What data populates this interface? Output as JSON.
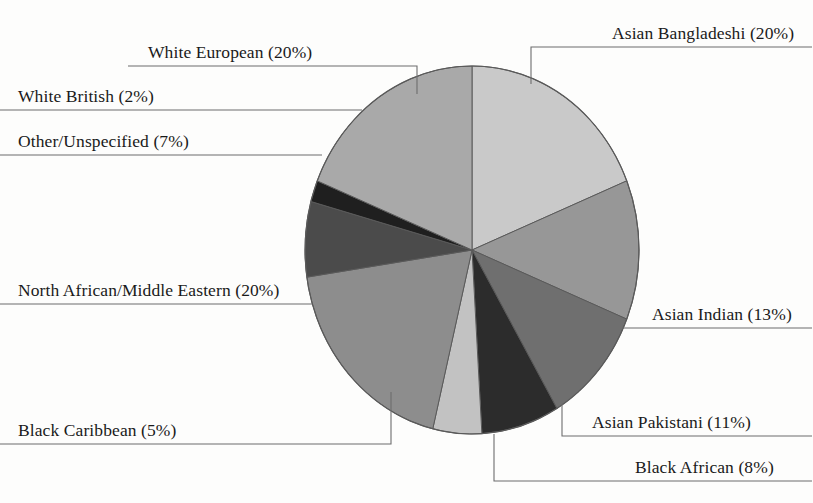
{
  "chart_data": {
    "type": "pie",
    "title": "",
    "subtitle": "",
    "xlabel": "",
    "ylabel": "",
    "legend_position": "callout-labels",
    "grid": false,
    "start_angle_deg": 0,
    "direction": "clockwise",
    "units": "percent",
    "total": 106,
    "categories": [
      "Asian Bangladeshi",
      "Asian Indian",
      "Asian Pakistani",
      "Black African",
      "Black Caribbean",
      "North African/Middle Eastern",
      "Other/Unspecified",
      "White British",
      "White European"
    ],
    "values": [
      20,
      13,
      11,
      8,
      5,
      20,
      7,
      2,
      20
    ],
    "slices": [
      {
        "id": "asian-bangladeshi",
        "label": "Asian Bangladeshi (20%)",
        "name": "Asian Bangladeshi",
        "value": 20,
        "color": "#c9c9c9"
      },
      {
        "id": "asian-indian",
        "label": "Asian Indian (13%)",
        "name": "Asian Indian",
        "value": 13,
        "color": "#979797"
      },
      {
        "id": "asian-pakistani",
        "label": "Asian Pakistani (11%)",
        "name": "Asian Pakistani",
        "value": 11,
        "color": "#6f6f6f"
      },
      {
        "id": "black-african",
        "label": "Black African (8%)",
        "name": "Black African",
        "value": 8,
        "color": "#2c2c2c"
      },
      {
        "id": "black-caribbean",
        "label": "Black Caribbean (5%)",
        "name": "Black Caribbean",
        "value": 5,
        "color": "#c2c2c2"
      },
      {
        "id": "north-african-middle-eastern",
        "label": "North African/Middle Eastern (20%)",
        "name": "North African/Middle Eastern",
        "value": 20,
        "color": "#8d8d8d"
      },
      {
        "id": "other-unspecified",
        "label": "Other/Unspecified (7%)",
        "name": "Other/Unspecified",
        "value": 7,
        "color": "#4b4b4b"
      },
      {
        "id": "white-british",
        "label": "White British (2%)",
        "name": "White British",
        "value": 2,
        "color": "#1f1f1f"
      },
      {
        "id": "white-european",
        "label": "White European (20%)",
        "name": "White European",
        "value": 20,
        "color": "#a9a9a9"
      }
    ],
    "colors": {
      "outline": "#5a5a5a",
      "leader_line": "#6d6d6d",
      "text": "#1a1a1a",
      "background": "#fdfdfc"
    }
  },
  "labels": {
    "asian_bangladeshi": "Asian Bangladeshi (20%)",
    "asian_indian": "Asian Indian (13%)",
    "asian_pakistani": "Asian Pakistani (11%)",
    "black_african": "Black African (8%)",
    "black_caribbean": "Black Caribbean (5%)",
    "north_african_middle_eastern": "North African/Middle Eastern (20%)",
    "other_unspecified": "Other/Unspecified (7%)",
    "white_british": "White British (2%)",
    "white_european": "White European (20%)"
  }
}
